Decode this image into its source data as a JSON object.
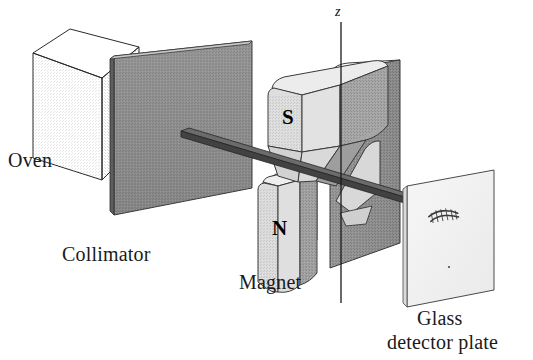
{
  "figure": {
    "background_color": "#ffffff",
    "width": 533,
    "height": 360
  },
  "labels": {
    "oven": "Oven",
    "collimator": "Collimator",
    "magnet": "Magnet",
    "glass_line1": "Glass",
    "glass_line2": "detector plate",
    "axis_z": "z",
    "pole_south": "S",
    "pole_north": "N"
  },
  "colors": {
    "outline": "#2b2b2b",
    "oven_top": "#ededed",
    "oven_left": "#dcdcdc",
    "oven_right": "#a9a9a9",
    "collimator_face": "#8d8d8d",
    "collimator_edge": "#5e5e5e",
    "magnet_top": "#e4e4e4",
    "magnet_left": "#d5d5d5",
    "magnet_right": "#9c9c9c",
    "magnet_back": "#8f8f8f",
    "beam": "#4a4a4a",
    "plate_face": "#f2f2f2",
    "deposit": "#3a3a3a",
    "axis_line": "#1a1a1a"
  },
  "components": [
    {
      "name": "oven",
      "label": "Oven",
      "description": "cubic source emitting an atomic beam"
    },
    {
      "name": "collimator",
      "label": "Collimator",
      "description": "flat slit plate narrowing the beam"
    },
    {
      "name": "magnet",
      "label": "Magnet",
      "description": "inhomogeneous field magnet with S pole above and N pole below"
    },
    {
      "name": "glass-detector-plate",
      "label": "Glass detector plate",
      "description": "plate collecting the split beam deposit"
    }
  ]
}
